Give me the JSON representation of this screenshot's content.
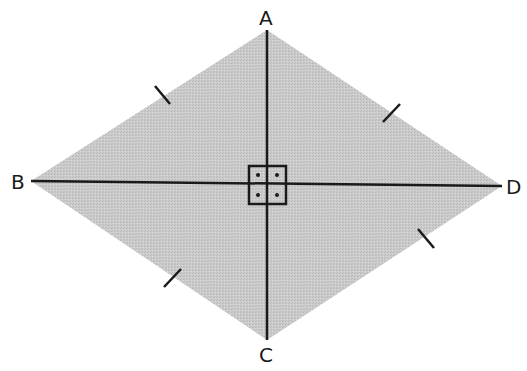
{
  "figure": {
    "type": "rhombus",
    "fill_color": "#c6c6c6",
    "stroke_color": "#1a1a1a",
    "vertices": {
      "A": {
        "label": "A",
        "x": 267,
        "y": 30
      },
      "B": {
        "label": "B",
        "x": 31,
        "y": 181
      },
      "C": {
        "label": "C",
        "x": 267,
        "y": 340
      },
      "D": {
        "label": "D",
        "x": 502,
        "y": 186
      }
    },
    "diagonals": [
      {
        "from": "A",
        "to": "C"
      },
      {
        "from": "B",
        "to": "D"
      }
    ],
    "right_angle_marker": {
      "center": {
        "x": 267,
        "y": 184
      },
      "size": 37,
      "quadrant_dots": 4
    },
    "congruence_ticks": [
      {
        "side": "AB",
        "count": 1
      },
      {
        "side": "AD",
        "count": 1
      },
      {
        "side": "BC",
        "count": 1
      },
      {
        "side": "CD",
        "count": 1
      }
    ]
  }
}
